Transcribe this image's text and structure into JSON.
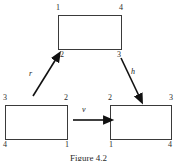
{
  "figure": {
    "caption": "Figure 4.2",
    "background_color": "#ffffff",
    "stroke_color": "#3a3a3a",
    "arrow_color": "#111111"
  },
  "rectangles": [
    {
      "id": "top",
      "name": "top-rectangle",
      "corners": {
        "top_left": "1",
        "top_right": "4",
        "bottom_left": "2",
        "bottom_right": "3"
      }
    },
    {
      "id": "bottom-left",
      "name": "bottom-left-rectangle",
      "corners": {
        "top_left": "3",
        "top_right": "2",
        "bottom_left": "4",
        "bottom_right": "1"
      }
    },
    {
      "id": "bottom-right",
      "name": "bottom-right-rectangle",
      "corners": {
        "top_left": "2",
        "top_right": "3",
        "bottom_left": "1",
        "bottom_right": "4"
      }
    }
  ],
  "arrows": [
    {
      "id": "r",
      "label": "r",
      "from": "bottom-left-rectangle",
      "to": "top-rectangle",
      "direction": "up-right"
    },
    {
      "id": "h",
      "label": "h",
      "from": "top-rectangle",
      "to": "bottom-right-rectangle",
      "direction": "down-right"
    },
    {
      "id": "v",
      "label": "v",
      "from": "bottom-left-rectangle",
      "to": "bottom-right-rectangle",
      "direction": "right"
    }
  ]
}
